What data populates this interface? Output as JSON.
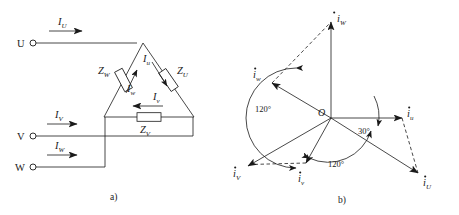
{
  "figure": {
    "panel_a": {
      "caption": "a)",
      "terminals": [
        {
          "name": "U",
          "label": "U"
        },
        {
          "name": "V",
          "label": "V"
        },
        {
          "name": "W",
          "label": "W"
        }
      ],
      "line_currents": [
        {
          "symbol": "I",
          "subscript": "U"
        },
        {
          "symbol": "I",
          "subscript": "V"
        },
        {
          "symbol": "I",
          "subscript": "W"
        }
      ],
      "impedances": [
        {
          "symbol": "Z",
          "subscript": "W"
        },
        {
          "symbol": "Z",
          "subscript": "U"
        },
        {
          "symbol": "Z",
          "subscript": "V"
        }
      ],
      "phase_currents": [
        {
          "symbol": "I",
          "subscript": "u"
        },
        {
          "symbol": "I",
          "subscript": "w"
        },
        {
          "symbol": "I",
          "subscript": "v"
        }
      ]
    },
    "panel_b": {
      "caption": "b)",
      "origin_label": "O",
      "angles": [
        {
          "value": "120°"
        },
        {
          "value": "120°"
        },
        {
          "value": "30°"
        }
      ],
      "line_phasors": [
        {
          "symbol": "i",
          "subscript": "W"
        },
        {
          "symbol": "i",
          "subscript": "V"
        },
        {
          "symbol": "i",
          "subscript": "U"
        }
      ],
      "phase_phasors": [
        {
          "symbol": "i",
          "subscript": "w"
        },
        {
          "symbol": "i",
          "subscript": "v"
        },
        {
          "symbol": "i",
          "subscript": "u"
        }
      ]
    }
  },
  "colors": {
    "ink": "#1a1a1a",
    "background": "#ffffff"
  }
}
